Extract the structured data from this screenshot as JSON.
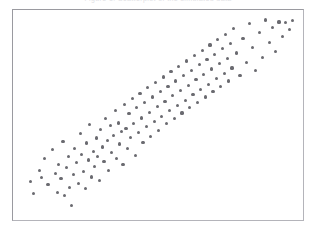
{
  "figure": {
    "background_color": "#ffffff",
    "frame_color": "#9a9aa0",
    "caption_remnant": "Figure  1:  Scatterplot  of  the  simulated  data"
  },
  "chart_data": {
    "type": "scatter",
    "title": "",
    "subtitle": "",
    "xlabel": "",
    "ylabel": "",
    "xlim": [
      0,
      100
    ],
    "ylim": [
      0,
      100
    ],
    "grid": false,
    "legend": false,
    "legend_position": "none",
    "tick_labels_x": [],
    "tick_labels_y": [],
    "annotations": [],
    "marker": {
      "shape": "circle",
      "color": "#6a6a70",
      "size_px": 3.2,
      "count": 133
    },
    "series": [
      {
        "name": "observations",
        "color": "#6a6a70",
        "points": [
          [
            4.0,
            16.3
          ],
          [
            5.3,
            10.5
          ],
          [
            7.3,
            22.1
          ],
          [
            8.1,
            18.4
          ],
          [
            9.1,
            28.0
          ],
          [
            10.4,
            14.7
          ],
          [
            12.1,
            32.4
          ],
          [
            13.0,
            20.6
          ],
          [
            13.9,
            11.0
          ],
          [
            14.2,
            25.2
          ],
          [
            15.1,
            17.9
          ],
          [
            15.8,
            36.8
          ],
          [
            16.3,
            9.5
          ],
          [
            17.1,
            23.6
          ],
          [
            17.9,
            28.9
          ],
          [
            18.2,
            13.4
          ],
          [
            18.9,
            4.2
          ],
          [
            19.5,
            19.8
          ],
          [
            20.1,
            33.1
          ],
          [
            20.6,
            26.0
          ],
          [
            21.3,
            15.6
          ],
          [
            22.0,
            40.5
          ],
          [
            22.6,
            30.2
          ],
          [
            23.1,
            21.4
          ],
          [
            23.8,
            12.8
          ],
          [
            24.2,
            35.9
          ],
          [
            24.9,
            27.3
          ],
          [
            25.4,
            45.1
          ],
          [
            26.0,
            18.7
          ],
          [
            26.7,
            31.6
          ],
          [
            27.1,
            24.0
          ],
          [
            27.8,
            38.4
          ],
          [
            28.3,
            29.1
          ],
          [
            28.9,
            16.9
          ],
          [
            29.4,
            42.7
          ],
          [
            30.0,
            33.8
          ],
          [
            30.6,
            26.5
          ],
          [
            31.2,
            48.2
          ],
          [
            31.8,
            37.0
          ],
          [
            32.3,
            21.8
          ],
          [
            32.9,
            44.6
          ],
          [
            33.4,
            30.9
          ],
          [
            34.0,
            39.5
          ],
          [
            34.6,
            52.3
          ],
          [
            35.1,
            28.2
          ],
          [
            35.7,
            46.0
          ],
          [
            36.2,
            35.4
          ],
          [
            36.8,
            41.7
          ],
          [
            37.4,
            24.9
          ],
          [
            37.9,
            55.1
          ],
          [
            38.5,
            43.3
          ],
          [
            39.0,
            33.0
          ],
          [
            39.6,
            50.8
          ],
          [
            40.2,
            38.6
          ],
          [
            40.7,
            58.2
          ],
          [
            41.3,
            45.9
          ],
          [
            41.8,
            29.4
          ],
          [
            42.4,
            53.7
          ],
          [
            43.0,
            41.1
          ],
          [
            43.5,
            61.0
          ],
          [
            44.1,
            48.5
          ],
          [
            44.6,
            36.2
          ],
          [
            45.2,
            56.4
          ],
          [
            45.8,
            44.0
          ],
          [
            46.3,
            63.8
          ],
          [
            46.9,
            51.2
          ],
          [
            47.4,
            39.0
          ],
          [
            48.0,
            59.1
          ],
          [
            48.6,
            46.7
          ],
          [
            49.1,
            66.5
          ],
          [
            49.7,
            54.3
          ],
          [
            50.2,
            42.0
          ],
          [
            50.8,
            61.8
          ],
          [
            51.4,
            49.4
          ],
          [
            51.9,
            69.2
          ],
          [
            52.5,
            57.0
          ],
          [
            53.0,
            45.6
          ],
          [
            53.6,
            64.5
          ],
          [
            54.2,
            52.1
          ],
          [
            54.7,
            71.9
          ],
          [
            55.3,
            59.7
          ],
          [
            55.8,
            48.3
          ],
          [
            56.4,
            67.2
          ],
          [
            57.0,
            54.8
          ],
          [
            57.5,
            74.6
          ],
          [
            58.1,
            62.4
          ],
          [
            58.6,
            51.0
          ],
          [
            59.2,
            69.9
          ],
          [
            59.8,
            57.5
          ],
          [
            60.3,
            77.3
          ],
          [
            60.9,
            65.1
          ],
          [
            61.4,
            53.7
          ],
          [
            62.0,
            72.6
          ],
          [
            62.6,
            60.2
          ],
          [
            63.1,
            80.0
          ],
          [
            63.7,
            67.8
          ],
          [
            64.2,
            56.4
          ],
          [
            64.8,
            75.3
          ],
          [
            65.4,
            62.9
          ],
          [
            65.9,
            82.7
          ],
          [
            66.5,
            70.5
          ],
          [
            67.0,
            59.1
          ],
          [
            67.6,
            78.0
          ],
          [
            68.2,
            65.6
          ],
          [
            68.7,
            85.4
          ],
          [
            69.3,
            73.2
          ],
          [
            69.8,
            61.8
          ],
          [
            70.4,
            80.7
          ],
          [
            71.0,
            68.3
          ],
          [
            71.5,
            88.1
          ],
          [
            72.1,
            75.9
          ],
          [
            72.6,
            64.5
          ],
          [
            73.2,
            83.4
          ],
          [
            73.8,
            71.0
          ],
          [
            74.3,
            90.8
          ],
          [
            74.9,
            78.6
          ],
          [
            75.4,
            67.2
          ],
          [
            76.0,
            86.1
          ],
          [
            76.6,
            73.7
          ],
          [
            77.1,
            93.5
          ],
          [
            78.3,
            81.3
          ],
          [
            79.5,
            69.9
          ],
          [
            80.6,
            88.8
          ],
          [
            81.8,
            76.4
          ],
          [
            82.9,
            96.2
          ],
          [
            84.1,
            84.0
          ],
          [
            85.2,
            72.6
          ],
          [
            86.4,
            91.5
          ],
          [
            87.5,
            79.1
          ],
          [
            88.7,
            98.0
          ],
          [
            90.0,
            86.7
          ],
          [
            91.2,
            94.3
          ],
          [
            92.3,
            82.0
          ],
          [
            93.5,
            97.0
          ],
          [
            94.8,
            89.5
          ],
          [
            96.0,
            96.6
          ],
          [
            97.2,
            93.0
          ],
          [
            98.3,
            97.8
          ]
        ]
      }
    ]
  }
}
